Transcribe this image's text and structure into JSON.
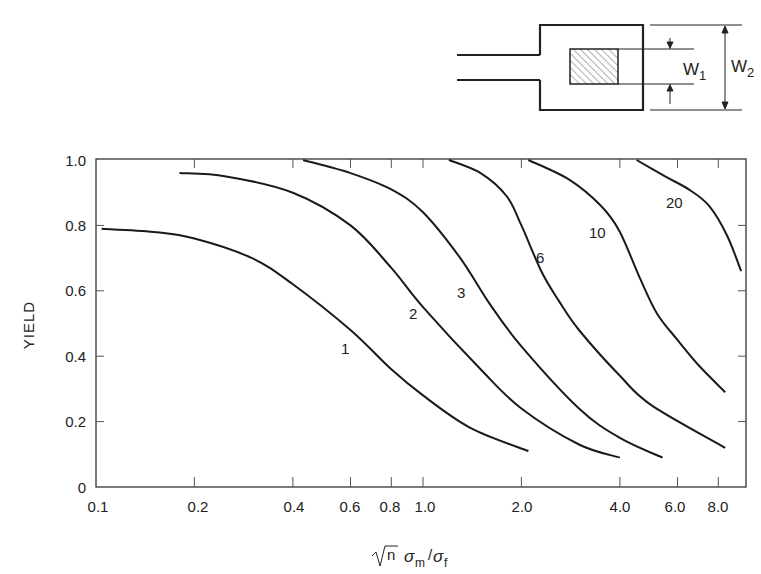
{
  "diagram": {
    "w1_label": "W",
    "w1_sub": "1",
    "w2_label": "W",
    "w2_sub": "2"
  },
  "axes": {
    "ylabel": "YIELD",
    "xlabel_sqrt": "n",
    "xlabel_sigma_m": "σ",
    "xlabel_m": "m",
    "xlabel_slash": "/",
    "xlabel_sigma_f": "σ",
    "xlabel_f": "f",
    "yticks": [
      "0",
      "0.2",
      "0.4",
      "0.6",
      "0.8",
      "1.0"
    ],
    "xticks": [
      "0.1",
      "0.2",
      "0.4",
      "0.6",
      "0.8",
      "1.0",
      "2.0",
      "4.0",
      "6.0",
      "8.0"
    ]
  },
  "chart_data": {
    "type": "line",
    "title": "",
    "xlabel": "√n σm/σf",
    "ylabel": "YIELD",
    "xscale": "log",
    "xlim": [
      0.1,
      10
    ],
    "ylim": [
      0,
      1.0
    ],
    "grid": false,
    "legend": "inline curve labels",
    "yticks": [
      0,
      0.2,
      0.4,
      0.6,
      0.8,
      1.0
    ],
    "xticks": [
      0.1,
      0.2,
      0.4,
      0.6,
      0.8,
      1.0,
      2.0,
      4.0,
      6.0,
      8.0
    ],
    "series": [
      {
        "name": "1",
        "x": [
          0.104,
          0.15,
          0.2,
          0.3,
          0.4,
          0.6,
          0.8,
          1.0,
          1.4,
          2.1
        ],
        "y": [
          0.79,
          0.78,
          0.76,
          0.7,
          0.62,
          0.48,
          0.36,
          0.28,
          0.18,
          0.11
        ]
      },
      {
        "name": "2",
        "x": [
          0.18,
          0.25,
          0.4,
          0.6,
          0.8,
          1.0,
          1.5,
          2.0,
          3.0,
          4.0
        ],
        "y": [
          0.96,
          0.95,
          0.9,
          0.8,
          0.67,
          0.55,
          0.36,
          0.24,
          0.13,
          0.09
        ]
      },
      {
        "name": "3",
        "x": [
          0.43,
          0.6,
          0.8,
          1.0,
          1.3,
          1.6,
          2.0,
          3.0,
          4.0,
          5.4
        ],
        "y": [
          1.0,
          0.96,
          0.91,
          0.84,
          0.7,
          0.56,
          0.43,
          0.24,
          0.15,
          0.09
        ]
      },
      {
        "name": "6",
        "x": [
          1.2,
          1.5,
          1.8,
          2.0,
          2.3,
          2.6,
          3.0,
          4.0,
          5.0,
          8.4
        ],
        "y": [
          1.0,
          0.96,
          0.89,
          0.8,
          0.66,
          0.57,
          0.48,
          0.34,
          0.25,
          0.12
        ]
      },
      {
        "name": "10",
        "x": [
          2.1,
          2.8,
          3.5,
          4.0,
          4.6,
          5.2,
          6.0,
          7.0,
          8.4
        ],
        "y": [
          1.0,
          0.94,
          0.86,
          0.78,
          0.64,
          0.53,
          0.45,
          0.37,
          0.29
        ]
      },
      {
        "name": "20",
        "x": [
          4.5,
          5.5,
          6.5,
          7.5,
          8.5,
          9.4
        ],
        "y": [
          1.0,
          0.95,
          0.91,
          0.86,
          0.77,
          0.66
        ]
      }
    ],
    "inset_diagram": "pad geometry with inner hatched square of width W1 inside outer square of width W2, with lead lines on left"
  }
}
